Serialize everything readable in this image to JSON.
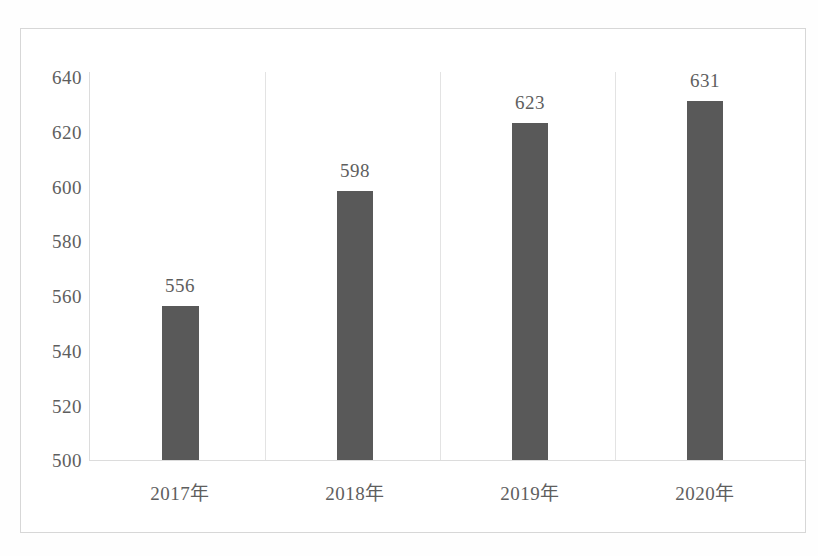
{
  "chart_data": {
    "type": "bar",
    "title": "",
    "subtitle": "",
    "xlabel": "",
    "ylabel": "",
    "categories": [
      "2017年",
      "2018年",
      "2019年",
      "2020年"
    ],
    "values": [
      556,
      598,
      623,
      631
    ],
    "data_labels": [
      "556",
      "598",
      "623",
      "631"
    ],
    "ylim": [
      500,
      640
    ],
    "ytick_values": [
      500,
      520,
      540,
      560,
      580,
      600,
      620,
      640
    ],
    "ytick_labels": [
      "500",
      "520",
      "540",
      "560",
      "580",
      "600",
      "620",
      "640"
    ],
    "grid": "vertical-category-dividers-only",
    "legend": "none",
    "series": [
      {
        "name": "",
        "values": [
          556,
          598,
          623,
          631
        ]
      }
    ]
  },
  "style": {
    "bar_color": "#595959",
    "text_color": "#5e5e5e",
    "axis_line_color": "#dcdcdc",
    "grid_line_color": "#e3e3e3",
    "frame_border_color": "#d7d7d7",
    "plot_background": "#ffffff",
    "page_background": "#fefefe"
  }
}
